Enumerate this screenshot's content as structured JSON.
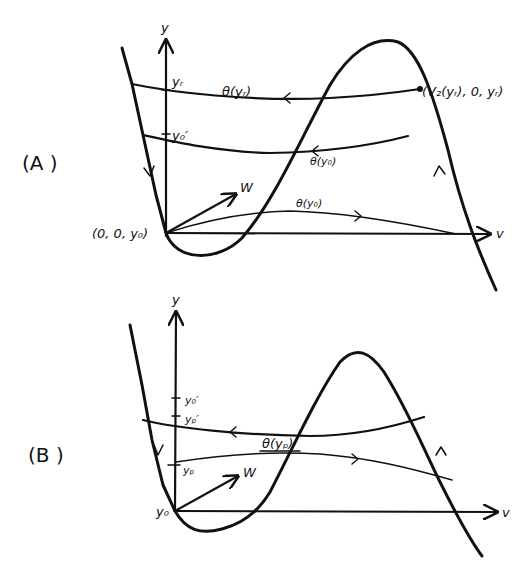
{
  "panels": {
    "A": {
      "label": "(A )",
      "axis_y": "y",
      "axis_v": "v",
      "vector": "W",
      "origin": "(0, 0, y₀)",
      "tick_yr": "yᵣ",
      "tick_y0p": "y₀′",
      "orbit_top": "θ(yᵣ)",
      "orbit_mid": "θ(y₀)",
      "orbit_low": "θ(y₀)",
      "point": "(V₂(yᵣ), 0, yᵣ)"
    },
    "B": {
      "label": "(B )",
      "axis_y": "y",
      "axis_v": "v",
      "vector": "W",
      "origin": "y₀",
      "tick_y0p": "y₀′",
      "tick_ypp": "yₚ′",
      "tick_yp": "yₚ",
      "orbit": "θ(yₚ)"
    }
  }
}
